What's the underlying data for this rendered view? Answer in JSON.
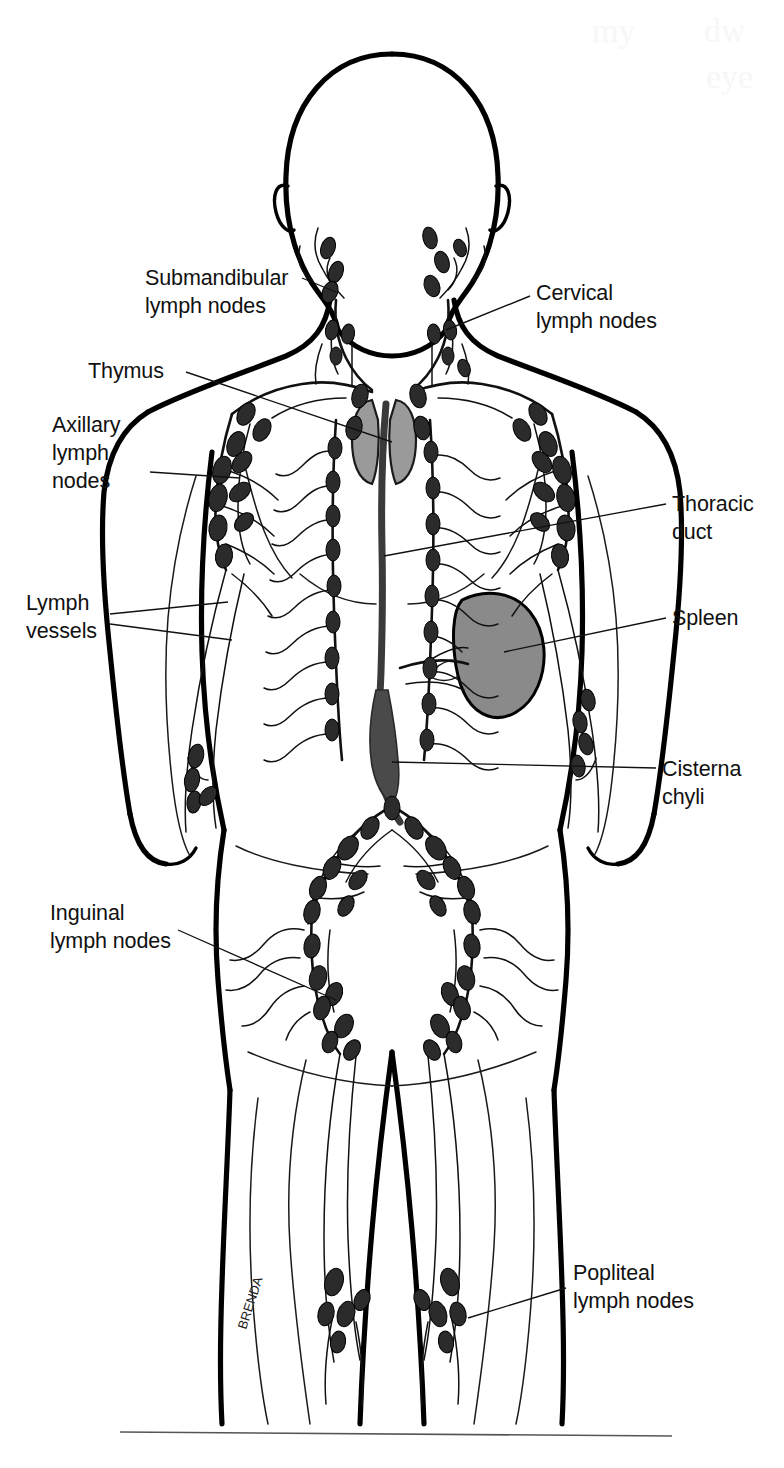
{
  "figure": {
    "view": "anterior full-body schematic",
    "artist_signature": "BRENDA"
  },
  "colors": {
    "ink": "#000000",
    "node_fill": "#2b2b2b",
    "organ_fill": "#8a8a8a",
    "thymus_fill": "#9a9a9a",
    "duct_fill": "#555555",
    "background": "#ffffff",
    "rule": "#555555"
  },
  "labels": [
    {
      "id": "submandibular",
      "line1": "Submandibular",
      "line2": "lymph nodes",
      "side": "left",
      "text_x": 145,
      "text_y": 285,
      "align": "start"
    },
    {
      "id": "cervical",
      "line1": "Cervical",
      "line2": "lymph nodes",
      "side": "right",
      "text_x": 536,
      "text_y": 300,
      "align": "start"
    },
    {
      "id": "thymus",
      "line1": "Thymus",
      "line2": "",
      "side": "left",
      "text_x": 88,
      "text_y": 378,
      "align": "start"
    },
    {
      "id": "axillary",
      "line1": "Axillary",
      "line2": "lymph",
      "line3": "nodes",
      "side": "left",
      "text_x": 52,
      "text_y": 432,
      "align": "start"
    },
    {
      "id": "thoracic-duct",
      "line1": "Thoracic",
      "line2": "duct",
      "side": "right",
      "text_x": 672,
      "text_y": 511,
      "align": "start"
    },
    {
      "id": "lymph-vessels",
      "line1": "Lymph",
      "line2": "vessels",
      "side": "left",
      "text_x": 26,
      "text_y": 610,
      "align": "start"
    },
    {
      "id": "spleen",
      "line1": "Spleen",
      "line2": "",
      "side": "right",
      "text_x": 672,
      "text_y": 625,
      "align": "start"
    },
    {
      "id": "cisterna",
      "line1": "Cisterna",
      "line2": "chyli",
      "side": "right",
      "text_x": 662,
      "text_y": 776,
      "align": "start"
    },
    {
      "id": "inguinal",
      "line1": "Inguinal",
      "line2": "lymph nodes",
      "side": "left",
      "text_x": 50,
      "text_y": 920,
      "align": "start"
    },
    {
      "id": "popliteal",
      "line1": "Popliteal",
      "line2": "lymph nodes",
      "side": "right",
      "text_x": 573,
      "text_y": 1280,
      "align": "start"
    }
  ],
  "structures": [
    {
      "name": "Submandibular lymph nodes",
      "region": "neck/jaw"
    },
    {
      "name": "Cervical lymph nodes",
      "region": "neck"
    },
    {
      "name": "Thymus",
      "region": "upper mediastinum"
    },
    {
      "name": "Axillary lymph nodes",
      "region": "armpit"
    },
    {
      "name": "Thoracic duct",
      "region": "thorax midline"
    },
    {
      "name": "Lymph vessels",
      "region": "limbs and trunk"
    },
    {
      "name": "Spleen",
      "region": "left upper abdomen"
    },
    {
      "name": "Cisterna chyli",
      "region": "lower abdomen midline"
    },
    {
      "name": "Inguinal lymph nodes",
      "region": "groin"
    },
    {
      "name": "Popliteal lymph nodes",
      "region": "behind the knee"
    }
  ],
  "ghost_text": {
    "line1": "my",
    "line2": "dw",
    "line3": "eye"
  }
}
